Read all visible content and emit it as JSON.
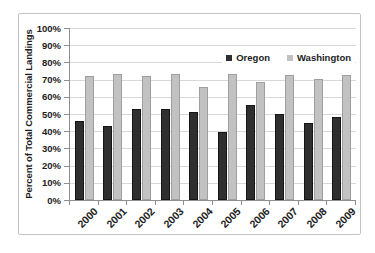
{
  "chart_data": {
    "type": "bar",
    "title": "",
    "xlabel": "",
    "ylabel": "Percent of Total Commercial Landings",
    "categories": [
      "2000",
      "2001",
      "2002",
      "2003",
      "2004",
      "2005",
      "2006",
      "2007",
      "2008",
      "2009"
    ],
    "series": [
      {
        "name": "Oregon",
        "color": "#2f2f2f",
        "border_color": "#151515",
        "values": [
          46,
          43,
          53,
          53,
          51,
          39.5,
          55.5,
          50,
          44.5,
          48.5
        ]
      },
      {
        "name": "Washington",
        "color": "#c2c2c2",
        "border_color": "#9f9f9f",
        "values": [
          72,
          73,
          72,
          73,
          65.5,
          73.5,
          68.5,
          72.5,
          70.5,
          72.5
        ]
      }
    ],
    "y_ticks": [
      "0%",
      "10%",
      "20%",
      "30%",
      "40%",
      "50%",
      "60%",
      "70%",
      "80%",
      "90%",
      "100%"
    ],
    "ylim": [
      0,
      100
    ],
    "grid": true,
    "legend_position": "inside-top-right"
  }
}
